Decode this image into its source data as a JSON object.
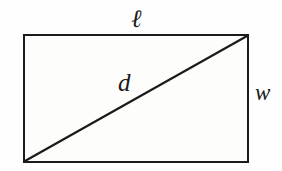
{
  "figure": {
    "kind": "geometry-diagram",
    "shape": "rectangle-with-diagonal",
    "background_color": "#fefefe",
    "stroke_color": "#1b1b1b",
    "fill_color": "#fdfdfc",
    "labels": {
      "length": "ℓ",
      "diagonal": "d",
      "width": "w"
    },
    "geometry": {
      "rectangle": {
        "left": 24,
        "top": 35,
        "right": 248,
        "bottom": 162,
        "width": 224,
        "height": 127,
        "stroke_width": 2.4
      },
      "diagonal": {
        "x1": 25,
        "y1": 161,
        "x2": 247,
        "y2": 36,
        "stroke_width": 2.2
      }
    }
  }
}
